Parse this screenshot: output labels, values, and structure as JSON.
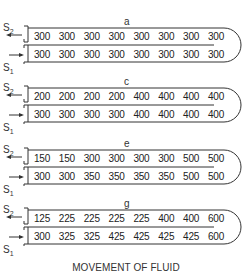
{
  "figure": {
    "caption": "MOVEMENT OF FLUID",
    "labels": {
      "s2": "S",
      "s2_sub": "2",
      "s1": "S",
      "s1_sub": "1"
    },
    "panels": [
      {
        "label": "a",
        "top_row": [
          "300",
          "300",
          "300",
          "300",
          "300",
          "300",
          "300",
          "300"
        ],
        "bottom_row": [
          "300",
          "300",
          "300",
          "300",
          "300",
          "300",
          "300",
          "300"
        ]
      },
      {
        "label": "c",
        "top_row": [
          "200",
          "200",
          "200",
          "200",
          "400",
          "400",
          "400",
          "400"
        ],
        "bottom_row": [
          "300",
          "300",
          "300",
          "300",
          "400",
          "400",
          "400",
          "400"
        ]
      },
      {
        "label": "e",
        "top_row": [
          "150",
          "150",
          "300",
          "300",
          "300",
          "300",
          "500",
          "500"
        ],
        "bottom_row": [
          "300",
          "300",
          "350",
          "350",
          "350",
          "350",
          "500",
          "500"
        ]
      },
      {
        "label": "g",
        "top_row": [
          "125",
          "225",
          "225",
          "225",
          "225",
          "400",
          "400",
          "600"
        ],
        "bottom_row": [
          "300",
          "325",
          "325",
          "425",
          "425",
          "425",
          "425",
          "600"
        ]
      }
    ],
    "colors": {
      "line": "#333333",
      "text": "#222222",
      "background": "#ffffff"
    }
  }
}
